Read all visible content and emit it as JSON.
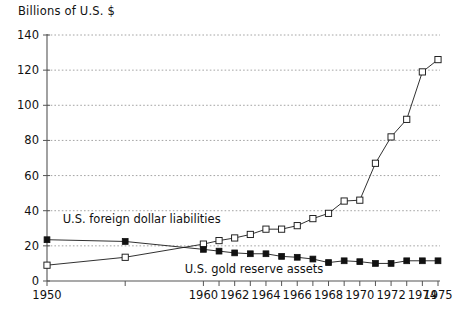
{
  "figure": {
    "axis_title": "Billions of U.S. $",
    "liabilities_label": "U.S. foreign dollar liabilities",
    "gold_label": "U.S. gold reserve assets",
    "line_color": "#1a1a1a",
    "grid_color": "#8d8d8d",
    "background": "#ffffff"
  },
  "chart_data": {
    "type": "line",
    "title": "",
    "subtitle": "",
    "xlabel": "",
    "ylabel": "Billions of U.S. $",
    "xlim": [
      1950,
      1975
    ],
    "ylim": [
      0,
      140
    ],
    "yticks": [
      0,
      20,
      40,
      60,
      80,
      100,
      120,
      140
    ],
    "ytick_labels": [
      "0",
      "20",
      "40",
      "60",
      "80",
      "100",
      "120",
      "140"
    ],
    "xticks": [
      1950,
      1955,
      1960,
      1961,
      1962,
      1963,
      1964,
      1965,
      1966,
      1967,
      1968,
      1969,
      1970,
      1971,
      1972,
      1973,
      1974,
      1975
    ],
    "xtick_labels_shown": [
      "1950",
      "1960",
      "1962",
      "1964",
      "1966",
      "1968",
      "1970",
      "1972",
      "1974",
      "1975"
    ],
    "xtick_labels_shown_at": [
      1950,
      1960,
      1962,
      1964,
      1966,
      1968,
      1970,
      1972,
      1974,
      1975
    ],
    "grid": true,
    "grid_axis": "y",
    "legend": "inline-annotations",
    "legend_position": "inside-plot",
    "series": [
      {
        "name": "U.S. foreign dollar liabilities",
        "marker": "open-square",
        "x": [
          1950,
          1955,
          1960,
          1961,
          1962,
          1963,
          1964,
          1965,
          1966,
          1967,
          1968,
          1969,
          1970,
          1971,
          1972,
          1973,
          1974,
          1975
        ],
        "values": [
          9,
          13.5,
          21,
          23,
          24.5,
          26.5,
          29.5,
          29.5,
          31.5,
          35.5,
          38.5,
          45.5,
          46,
          67,
          82,
          92,
          119,
          126
        ]
      },
      {
        "name": "U.S. gold reserve assets",
        "marker": "filled-square",
        "x": [
          1950,
          1955,
          1960,
          1961,
          1962,
          1963,
          1964,
          1965,
          1966,
          1967,
          1968,
          1969,
          1970,
          1971,
          1972,
          1973,
          1974,
          1975
        ],
        "values": [
          23.5,
          22.5,
          18,
          17,
          16,
          15.5,
          15.5,
          14,
          13.5,
          12.5,
          10.5,
          11.5,
          11,
          10,
          10,
          11.5,
          11.5,
          11.5
        ]
      }
    ],
    "annotations": [
      {
        "text": "U.S. foreign dollar liabilities",
        "x": 1951,
        "y": 33
      },
      {
        "text": "U.S. gold reserve assets",
        "x": 1958.8,
        "y": 4.5
      }
    ]
  }
}
